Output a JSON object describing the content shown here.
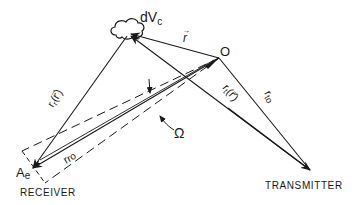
{
  "diagram": {
    "type": "bistatic scattering geometry",
    "colors": {
      "ink": "#1a1a1a",
      "background": "#ffffff"
    },
    "nodes": {
      "volume_element": {
        "label": "dV",
        "subscript": "c"
      },
      "origin": {
        "label": "O"
      },
      "receiver": {
        "label": "A",
        "subscript": "e",
        "caption": "RECEIVER"
      },
      "transmitter": {
        "caption": "TRANSMITTER"
      }
    },
    "vectors": {
      "r": {
        "label": "r",
        "arrow": "→"
      },
      "r_r": {
        "label": "r",
        "subscript": "r",
        "argument": "(r⃗)"
      },
      "r_ro": {
        "label": "r",
        "subscript": "ro"
      },
      "r_t": {
        "label": "r",
        "subscript": "t",
        "argument": "(r⃗)"
      },
      "r_to": {
        "label": "r",
        "subscript": "to"
      }
    },
    "solid_angle": {
      "label": "Ω"
    }
  }
}
